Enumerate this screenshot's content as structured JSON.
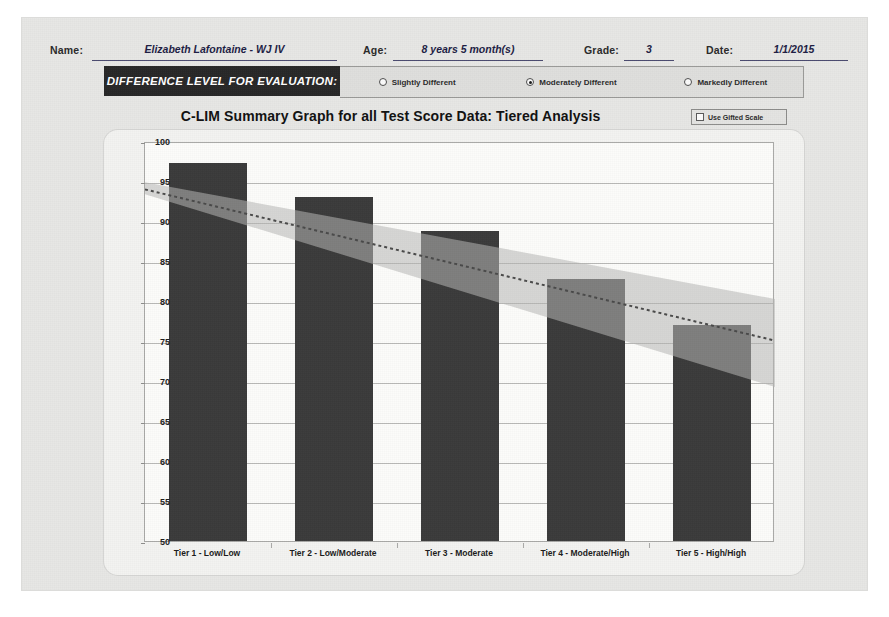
{
  "form": {
    "name_label": "Name:",
    "name_value": "Elizabeth Lafontaine - WJ IV",
    "age_label": "Age:",
    "age_value": "8 years 5 month(s)",
    "grade_label": "Grade:",
    "grade_value": "3",
    "date_label": "Date:",
    "date_value": "1/1/2015"
  },
  "difference_level": {
    "title": "DIFFERENCE LEVEL FOR EVALUATION:",
    "options": [
      {
        "label": "Slightly Different",
        "selected": false
      },
      {
        "label": "Moderately Different",
        "selected": true
      },
      {
        "label": "Markedly Different",
        "selected": false
      }
    ]
  },
  "chart_header": {
    "title": "C-LIM Summary Graph for all Test Score Data: Tiered Analysis",
    "gifted_scale_label": "Use Gifted Scale",
    "gifted_scale_checked": false
  },
  "colors": {
    "bar": "#3b3b3b",
    "band": "#b6b6b4",
    "trend": "#4a4a4a",
    "panel": "#f3f3f1",
    "plot_bg": "#fcfcfa",
    "sheet": "#e7e7e5",
    "dif_title_bg": "#272727"
  },
  "chart_data": {
    "type": "bar",
    "title": "C-LIM Summary Graph for all Test Score Data: Tiered Analysis",
    "xlabel": "",
    "ylabel": "",
    "ylim": [
      50,
      100
    ],
    "ytick_step": 5,
    "yticks": [
      50,
      55,
      60,
      65,
      70,
      75,
      80,
      85,
      90,
      95,
      100
    ],
    "grid": true,
    "legend": "none",
    "categories": [
      "Tier 1 - Low/Low",
      "Tier 2 - Low/Moderate",
      "Tier 3 - Moderate",
      "Tier 4 - Moderate/High",
      "Tier 5 - High/High"
    ],
    "values": [
      97.2,
      93.0,
      88.7,
      82.7,
      77.0
    ],
    "overlays": [
      {
        "name": "expected-range-band",
        "type": "area",
        "x": [
          0,
          1
        ],
        "upper": [
          95.1,
          80.5
        ],
        "lower": [
          93.6,
          69.5
        ],
        "color": "#b6b6b4",
        "opacity": 0.55
      },
      {
        "name": "expected-trend-line",
        "type": "line",
        "style": "dotted",
        "x": [
          0,
          1
        ],
        "y": [
          94.2,
          75.3
        ],
        "color": "#4a4a4a"
      }
    ]
  }
}
